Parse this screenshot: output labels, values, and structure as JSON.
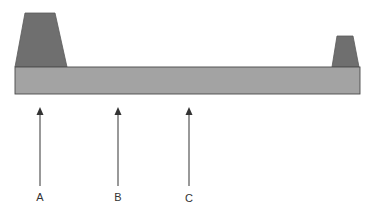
{
  "diagram": {
    "colors": {
      "trapezoid": "#6f6f6f",
      "bar": "#a3a3a3",
      "outline": "#4a4a4a",
      "arrow": "#555555"
    },
    "bar": {
      "x": 15,
      "y": 67,
      "width": 345,
      "height": 27
    },
    "left_block": {
      "points": "25,13 55,13 67,67 15,67"
    },
    "right_block": {
      "points": "337,36 353,36 359,67 332,67"
    },
    "arrows": [
      {
        "label": "A",
        "x": 40,
        "tip_y": 108,
        "base_y": 186,
        "label_y": 191
      },
      {
        "label": "B",
        "x": 118,
        "tip_y": 108,
        "base_y": 186,
        "label_y": 191
      },
      {
        "label": "C",
        "x": 189,
        "tip_y": 108,
        "base_y": 186,
        "label_y": 192
      }
    ]
  }
}
